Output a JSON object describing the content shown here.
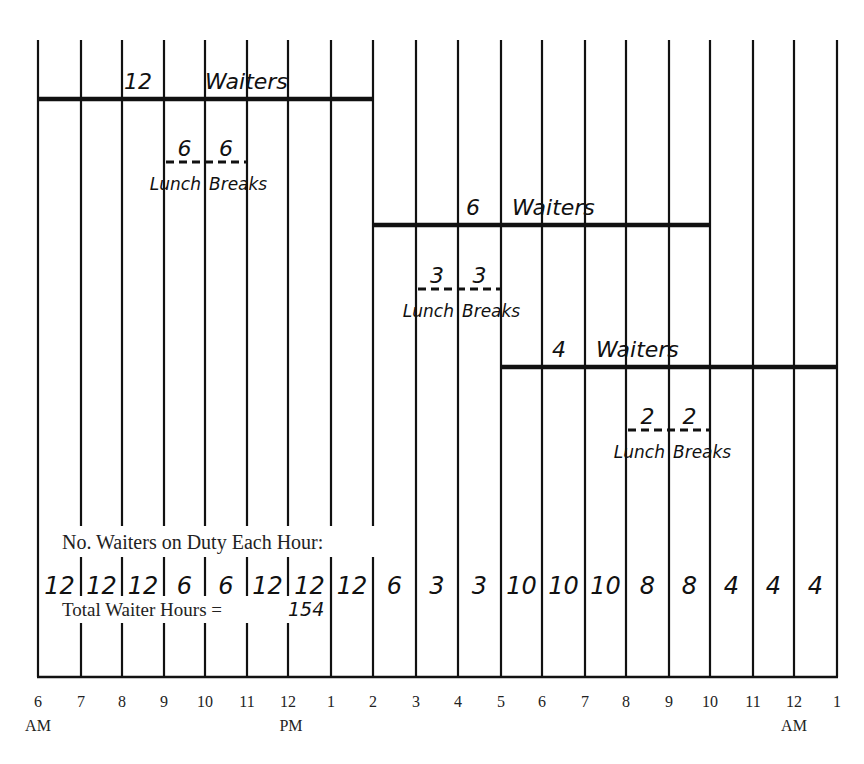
{
  "chart_data": {
    "type": "table",
    "x_axis": {
      "tick_labels": [
        "6",
        "7",
        "8",
        "9",
        "10",
        "11",
        "12",
        "1",
        "2",
        "3",
        "4",
        "5",
        "6",
        "7",
        "8",
        "9",
        "10",
        "11",
        "12",
        "1"
      ],
      "period_labels": [
        {
          "at_index": 0,
          "label": "AM"
        },
        {
          "at_index": 6,
          "label": "PM"
        },
        {
          "at_index": 18,
          "label": "AM"
        }
      ]
    },
    "shifts": [
      {
        "label": "12 Waiters",
        "count": 12,
        "start_index": 0,
        "end_index": 8,
        "lunch_break": {
          "label": "Lunch Breaks",
          "split": [
            6,
            6
          ],
          "start_index": 3,
          "end_index": 5
        }
      },
      {
        "label": "6 Waiters",
        "count": 6,
        "start_index": 8,
        "end_index": 16,
        "lunch_break": {
          "label": "Lunch Breaks",
          "split": [
            3,
            3
          ],
          "start_index": 9,
          "end_index": 11
        }
      },
      {
        "label": "4 Waiters",
        "count": 4,
        "start_index": 11,
        "end_index": 19,
        "lunch_break": {
          "label": "Lunch Breaks",
          "split": [
            2,
            2
          ],
          "start_index": 14,
          "end_index": 16
        }
      }
    ],
    "hourly_caption": "No. Waiters on Duty Each Hour:",
    "hourly_counts": [
      12,
      12,
      12,
      6,
      6,
      12,
      12,
      12,
      6,
      3,
      3,
      10,
      10,
      10,
      8,
      8,
      4,
      4,
      4
    ],
    "total_label": "Total Waiter Hours =",
    "total_value": "154",
    "grid": true
  },
  "labels": {
    "lunch": "Lunch",
    "breaks": "Breaks",
    "waiters": "Waiters"
  }
}
